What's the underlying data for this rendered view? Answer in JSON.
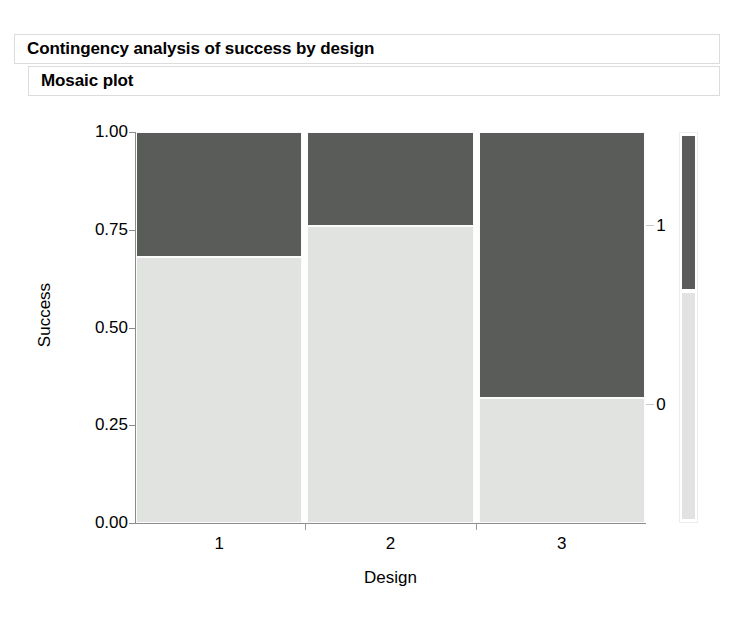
{
  "report": {
    "title": "Contingency analysis of success by design",
    "section_title": "Mosaic plot"
  },
  "chart_data": {
    "type": "mosaic",
    "title": "Mosaic plot",
    "xlabel": "Design",
    "ylabel": "Success",
    "ylim": [
      0.0,
      1.0
    ],
    "grid": false,
    "legend_position": "right",
    "y_ticks": [
      "0.00",
      "0.25",
      "0.50",
      "0.75",
      "1.00"
    ],
    "y_tick_values": [
      0.0,
      0.25,
      0.5,
      0.75,
      1.0
    ],
    "categories": [
      "1",
      "2",
      "3"
    ],
    "response_levels": [
      "1",
      "0"
    ],
    "legend_entries": [
      {
        "label": "1",
        "color": "#5a5c5a"
      },
      {
        "label": "0",
        "color": "#e1e3e1"
      }
    ],
    "colors": {
      "level_1": "#5a5c5a",
      "level_0": "#e1e3e1"
    },
    "column_widths": [
      0.33,
      0.33,
      0.33
    ],
    "columns": [
      {
        "category": "1",
        "width_fraction": 0.327,
        "segments": [
          {
            "level": "1",
            "proportion": 0.32
          },
          {
            "level": "0",
            "proportion": 0.68
          }
        ]
      },
      {
        "category": "2",
        "width_fraction": 0.327,
        "segments": [
          {
            "level": "1",
            "proportion": 0.24
          },
          {
            "level": "0",
            "proportion": 0.76
          }
        ]
      },
      {
        "category": "3",
        "width_fraction": 0.327,
        "segments": [
          {
            "level": "1",
            "proportion": 0.68
          },
          {
            "level": "0",
            "proportion": 0.32
          }
        ]
      }
    ]
  }
}
